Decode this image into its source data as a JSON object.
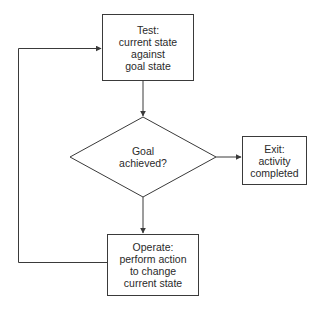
{
  "diagram": {
    "type": "flowchart",
    "colors": {
      "stroke": "#3a3a3a",
      "text": "#2a2a2a",
      "background": "#ffffff"
    },
    "nodes": {
      "test": {
        "shape": "rectangle",
        "lines": [
          "Test:",
          "current state",
          "against",
          "goal state"
        ]
      },
      "decision": {
        "shape": "diamond",
        "lines": [
          "Goal",
          "achieved?"
        ]
      },
      "exit": {
        "shape": "rectangle",
        "lines": [
          "Exit:",
          "activity",
          "completed"
        ]
      },
      "operate": {
        "shape": "rectangle",
        "lines": [
          "Operate:",
          "perform action",
          "to change",
          "current state"
        ]
      }
    },
    "edges": [
      {
        "from": "test",
        "to": "decision"
      },
      {
        "from": "decision",
        "to": "exit"
      },
      {
        "from": "decision",
        "to": "operate"
      },
      {
        "from": "operate",
        "to": "test",
        "route": "loop-left"
      }
    ]
  }
}
